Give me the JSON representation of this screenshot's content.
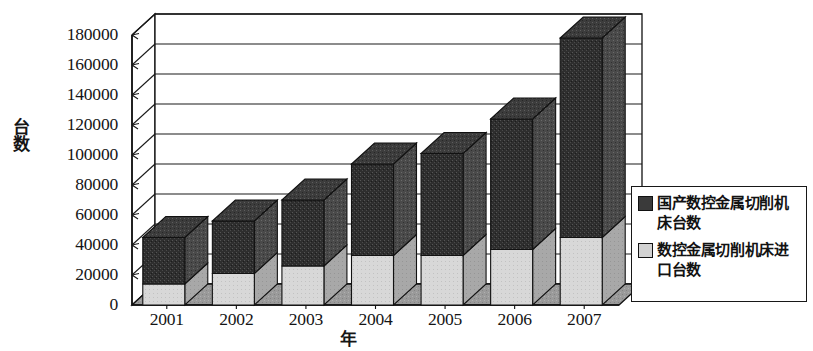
{
  "chart_data": {
    "type": "bar",
    "subtype": "stacked-column-3d",
    "title": "",
    "xlabel": "年",
    "ylabel": "台数",
    "categories": [
      "2001",
      "2002",
      "2003",
      "2004",
      "2005",
      "2006",
      "2007"
    ],
    "series": [
      {
        "name": "数控金属切削机床进口台数",
        "color": "#d2d2d2",
        "values": [
          14000,
          21000,
          26000,
          33000,
          33000,
          37000,
          45000
        ]
      },
      {
        "name": "国产数控金属切削机床台数",
        "color": "#3a3a3a",
        "values": [
          31000,
          35000,
          44000,
          61000,
          68000,
          87000,
          133000
        ]
      }
    ],
    "stacked_totals": [
      45000,
      56000,
      70000,
      94000,
      101000,
      124000,
      178000
    ],
    "ylim": [
      0,
      180000
    ],
    "ytick_values": [
      0,
      20000,
      40000,
      60000,
      80000,
      100000,
      120000,
      140000,
      160000,
      180000
    ],
    "ytick_labels": [
      "0",
      "20000",
      "40000",
      "60000",
      "80000",
      "100000",
      "120000",
      "140000",
      "160000",
      "180000"
    ],
    "grid": true,
    "legend_position": "right"
  },
  "legend": {
    "entries": [
      {
        "label": "国产数控金属切削机床台数",
        "swatch": "dark-swatch"
      },
      {
        "label": "数控金属切削机床进口台数",
        "swatch": "light-swatch"
      }
    ]
  }
}
